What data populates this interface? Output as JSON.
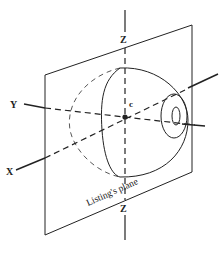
{
  "diagram": {
    "labels": {
      "z_top": "Z",
      "z_bottom": "Z",
      "y_axis": "Y",
      "x_axis": "X",
      "center": "c",
      "plane": "Listing's plane"
    },
    "colors": {
      "stroke": "#222222",
      "background": "#ffffff"
    }
  }
}
